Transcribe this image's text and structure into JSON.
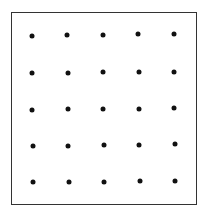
{
  "diagram": {
    "type": "dot-grid",
    "rows": 5,
    "columns": 5,
    "border_color": "#333333",
    "dot_color": "#111111",
    "dots": [
      {
        "row": 0,
        "col": 0,
        "x": 32,
        "y": 36
      },
      {
        "row": 0,
        "col": 1,
        "x": 67,
        "y": 35
      },
      {
        "row": 0,
        "col": 2,
        "x": 103,
        "y": 35
      },
      {
        "row": 0,
        "col": 3,
        "x": 138,
        "y": 34
      },
      {
        "row": 0,
        "col": 4,
        "x": 174,
        "y": 34
      },
      {
        "row": 1,
        "col": 0,
        "x": 32,
        "y": 73
      },
      {
        "row": 1,
        "col": 1,
        "x": 68,
        "y": 73
      },
      {
        "row": 1,
        "col": 2,
        "x": 103,
        "y": 72
      },
      {
        "row": 1,
        "col": 3,
        "x": 139,
        "y": 72
      },
      {
        "row": 1,
        "col": 4,
        "x": 174,
        "y": 72
      },
      {
        "row": 2,
        "col": 0,
        "x": 32,
        "y": 110
      },
      {
        "row": 2,
        "col": 1,
        "x": 68,
        "y": 109
      },
      {
        "row": 2,
        "col": 2,
        "x": 103,
        "y": 109
      },
      {
        "row": 2,
        "col": 3,
        "x": 139,
        "y": 109
      },
      {
        "row": 2,
        "col": 4,
        "x": 174,
        "y": 108
      },
      {
        "row": 3,
        "col": 0,
        "x": 33,
        "y": 146
      },
      {
        "row": 3,
        "col": 1,
        "x": 68,
        "y": 146
      },
      {
        "row": 3,
        "col": 2,
        "x": 104,
        "y": 145
      },
      {
        "row": 3,
        "col": 3,
        "x": 139,
        "y": 145
      },
      {
        "row": 3,
        "col": 4,
        "x": 175,
        "y": 144
      },
      {
        "row": 4,
        "col": 0,
        "x": 33,
        "y": 182
      },
      {
        "row": 4,
        "col": 1,
        "x": 69,
        "y": 182
      },
      {
        "row": 4,
        "col": 2,
        "x": 104,
        "y": 182
      },
      {
        "row": 4,
        "col": 3,
        "x": 140,
        "y": 181
      },
      {
        "row": 4,
        "col": 4,
        "x": 175,
        "y": 181
      }
    ]
  }
}
